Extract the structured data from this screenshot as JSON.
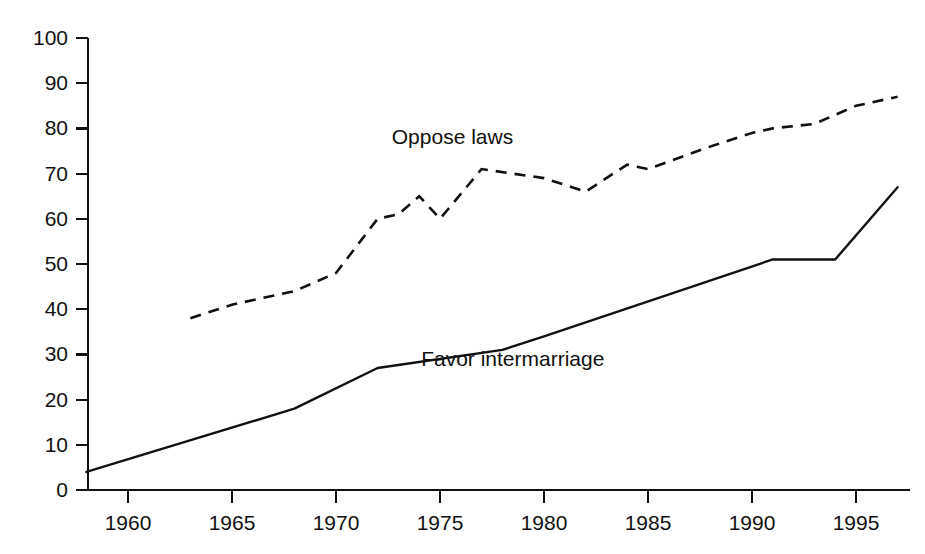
{
  "chart_data": {
    "type": "line",
    "title": "",
    "subtitle": "",
    "xlabel": "",
    "ylabel": "",
    "xlim": [
      1958,
      1997
    ],
    "ylim": [
      0,
      100
    ],
    "grid": false,
    "legend_position": "inline-annotations",
    "x_ticks": [
      1960,
      1965,
      1970,
      1975,
      1980,
      1985,
      1990,
      1995
    ],
    "x_tick_labels": [
      "1960",
      "1965",
      "1970",
      "1975",
      "1980",
      "1985",
      "1990",
      "1995"
    ],
    "y_ticks": [
      0,
      10,
      20,
      30,
      40,
      50,
      60,
      70,
      80,
      90,
      100
    ],
    "y_tick_labels": [
      "0",
      "10",
      "20",
      "30",
      "40",
      "50",
      "60",
      "70",
      "80",
      "90",
      "100"
    ],
    "series": [
      {
        "name": "Oppose laws",
        "style": "dashed",
        "color": "#111111",
        "label_text": "Oppose laws",
        "label_x": 1975.6,
        "label_y": 76.5,
        "x": [
          1963,
          1965,
          1968,
          1970,
          1972,
          1973,
          1974,
          1975,
          1977,
          1980,
          1982,
          1984,
          1985,
          1988,
          1990,
          1991,
          1993,
          1995,
          1997
        ],
        "values": [
          38,
          41,
          44,
          48,
          60,
          61,
          65,
          60,
          71,
          69,
          66,
          72,
          71,
          76,
          79,
          80,
          81,
          85,
          87
        ]
      },
      {
        "name": "Favor intermarriage",
        "style": "solid",
        "color": "#111111",
        "label_text": "Favor intermarriage",
        "label_x": 1978.5,
        "label_y": 27.5,
        "x": [
          1958,
          1968,
          1972,
          1978,
          1980,
          1991,
          1994,
          1997
        ],
        "values": [
          4,
          18,
          27,
          31,
          34,
          51,
          51,
          67
        ]
      }
    ]
  }
}
